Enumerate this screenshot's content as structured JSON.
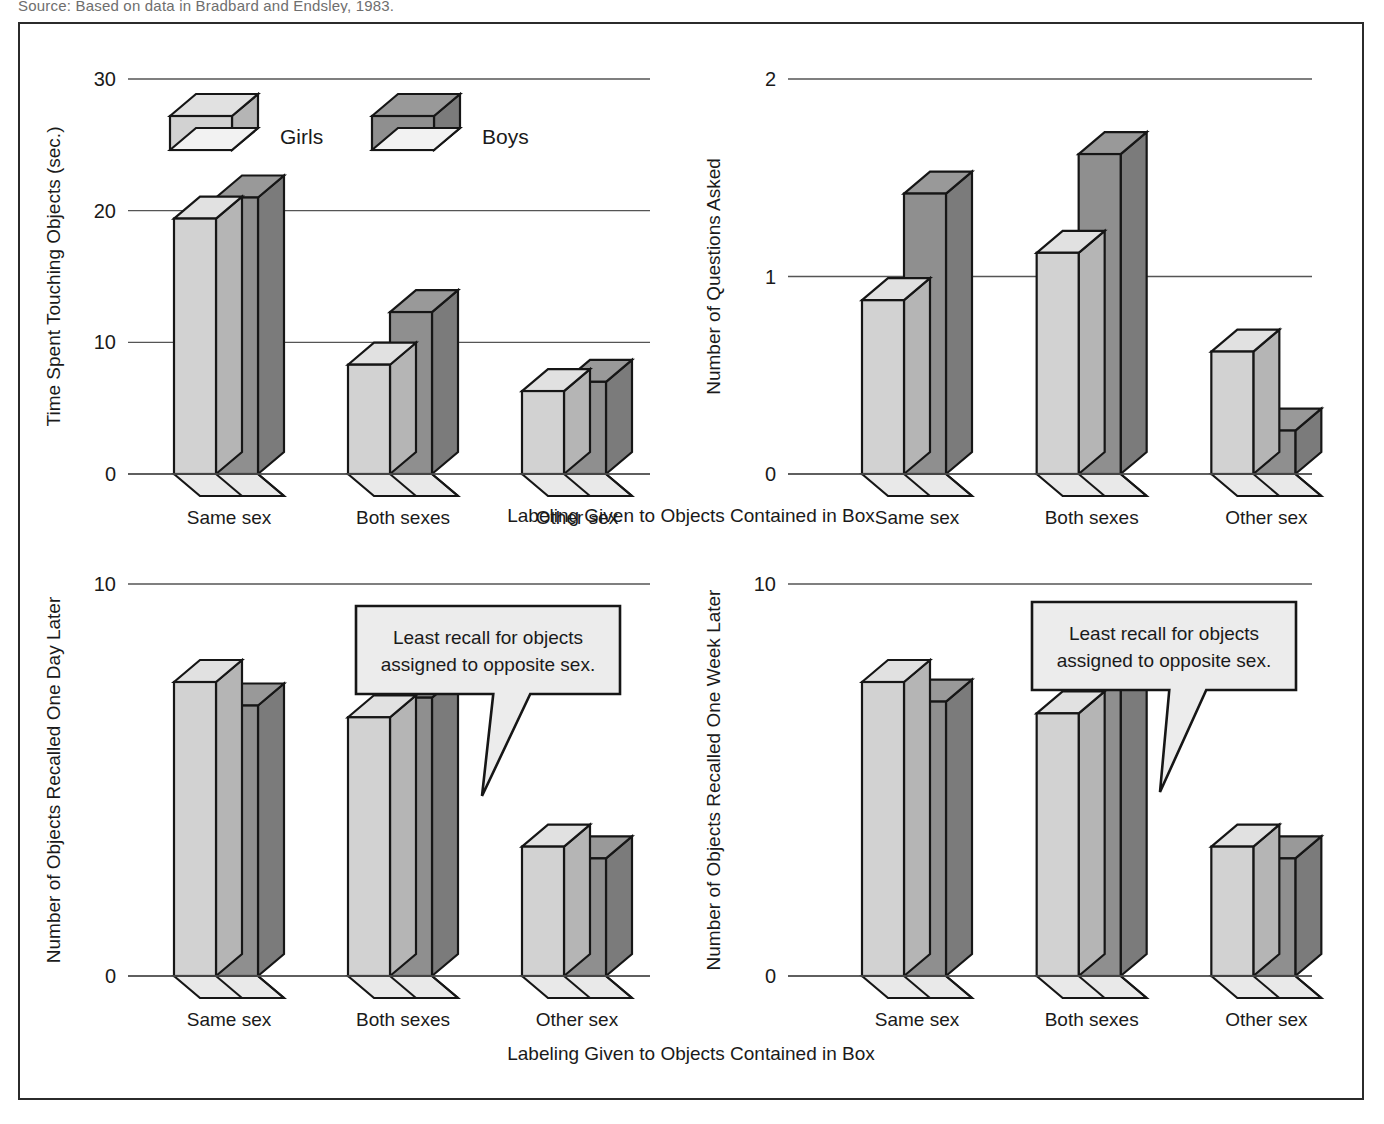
{
  "source_note": "Source: Based on data in Bradbard and Endsley, 1983.",
  "legend": {
    "girls_label": "Girls",
    "boys_label": "Boys",
    "girls_color": "#d2d2d2",
    "boys_color": "#8f8f8f"
  },
  "shared": {
    "categories": [
      "Same sex",
      "Both sexes",
      "Other sex"
    ],
    "xlabel": "Labeling Given to Objects Contained in Box"
  },
  "axis_titles": {
    "xaxis_top": "Labeling Given to Objects Contained in Box",
    "xaxis_bottom": "Labeling Given to Objects Contained in Box"
  },
  "callout": {
    "line1": "Least recall for objects",
    "line2": "assigned to opposite sex."
  },
  "chart_data": [
    {
      "id": "touching",
      "type": "bar",
      "title": "",
      "ylabel": "Time Spent Touching Objects (sec.)",
      "xlabel": "Labeling Given to Objects Contained in Box",
      "categories": [
        "Same sex",
        "Both sexes",
        "Other sex"
      ],
      "ylim": [
        0,
        30
      ],
      "yticks": [
        0,
        10,
        20,
        30
      ],
      "ytick_labels": [
        "0",
        "10",
        "20",
        "30"
      ],
      "grid": true,
      "legend_position": "top-left-inside",
      "series": [
        {
          "name": "Girls",
          "values": [
            19.4,
            8.3,
            6.3
          ]
        },
        {
          "name": "Boys",
          "values": [
            21.0,
            12.3,
            7.0
          ]
        }
      ]
    },
    {
      "id": "questions",
      "type": "bar",
      "title": "",
      "ylabel": "Number of Questions Asked",
      "xlabel": "Labeling Given to Objects Contained in Box",
      "categories": [
        "Same sex",
        "Both sexes",
        "Other sex"
      ],
      "ylim": [
        0,
        2
      ],
      "yticks": [
        0,
        1,
        2
      ],
      "ytick_labels": [
        "0",
        "1",
        "2"
      ],
      "grid": true,
      "legend_position": "none",
      "series": [
        {
          "name": "Girls",
          "values": [
            0.88,
            1.12,
            0.62
          ]
        },
        {
          "name": "Boys",
          "values": [
            1.42,
            1.62,
            0.22
          ]
        }
      ]
    },
    {
      "id": "recall-day",
      "type": "bar",
      "title": "",
      "ylabel": "Number of Objects Recalled One Day Later",
      "xlabel": "Labeling Given to Objects Contained in Box",
      "categories": [
        "Same sex",
        "Both sexes",
        "Other sex"
      ],
      "ylim": [
        0,
        10
      ],
      "yticks": [
        0,
        10
      ],
      "ytick_labels": [
        "0",
        "10"
      ],
      "grid": true,
      "legend_position": "none",
      "annotation": "Least recall for objects assigned to opposite sex.",
      "series": [
        {
          "name": "Girls",
          "values": [
            7.5,
            6.6,
            3.3
          ]
        },
        {
          "name": "Boys",
          "values": [
            6.9,
            7.1,
            3.0
          ]
        }
      ]
    },
    {
      "id": "recall-week",
      "type": "bar",
      "title": "",
      "ylabel": "Number of Objects Recalled One Week Later",
      "xlabel": "Labeling Given to Objects Contained in Box",
      "categories": [
        "Same sex",
        "Both sexes",
        "Other sex"
      ],
      "ylim": [
        0,
        10
      ],
      "yticks": [
        0,
        10
      ],
      "ytick_labels": [
        "0",
        "10"
      ],
      "grid": true,
      "legend_position": "none",
      "annotation": "Least recall for objects assigned to opposite sex.",
      "series": [
        {
          "name": "Girls",
          "values": [
            7.5,
            6.7,
            3.3
          ]
        },
        {
          "name": "Boys",
          "values": [
            7.0,
            7.3,
            3.0
          ]
        }
      ]
    }
  ]
}
